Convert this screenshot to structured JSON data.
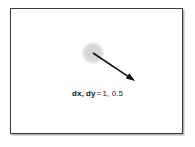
{
  "figure": {
    "kind": "vector-diagram",
    "background_color": "#ffffff",
    "frame": {
      "border_color": "#3a3a3a",
      "shadow_color": "#787878",
      "fill_color": "#ffffff"
    },
    "ball": {
      "label": "ball",
      "center_x": 82,
      "center_y": 44,
      "radius": 11,
      "fill_color": "#d8d8d8"
    },
    "vector_arrow": {
      "label": "velocity-vector",
      "start_x": 82,
      "start_y": 44,
      "end_x": 124,
      "end_y": 72,
      "stroke_color": "#111111",
      "stroke_width": 1.6,
      "arrowhead_length": 9,
      "arrowhead_width": 6
    },
    "caption": {
      "label": "dx, dy",
      "equals": "=",
      "value": "1, 0.5",
      "full_text": "dx, dy = 1, 0.5",
      "text_color": "#1c1c1c"
    }
  }
}
